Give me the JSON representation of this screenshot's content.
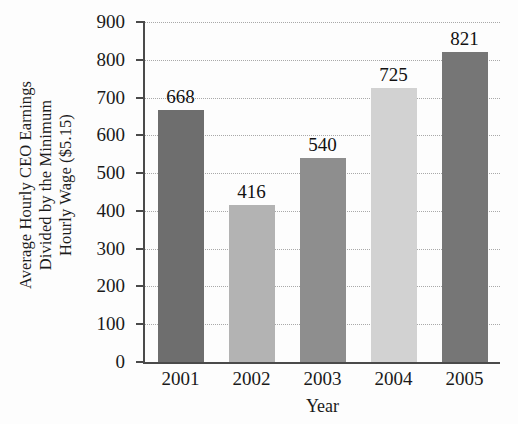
{
  "page_bleed_text": "",
  "chart_data": {
    "type": "bar",
    "title": "",
    "xlabel": "Year",
    "ylabel": "Average Hourly CEO Earnings Divided by the Minimum Hourly Wage ($5.15)",
    "ylabel_line1": "Average Hourly CEO Earnings",
    "ylabel_line2": "Divided by the Minimum",
    "ylabel_line3": "Hourly Wage ($5.15)",
    "categories": [
      "2001",
      "2002",
      "2003",
      "2004",
      "2005"
    ],
    "values": [
      668,
      416,
      540,
      725,
      821
    ],
    "value_labels": [
      "668",
      "416",
      "540",
      "725",
      "821"
    ],
    "bar_colors": [
      "#6e6e6e",
      "#b3b3b3",
      "#8e8e8e",
      "#d2d2d2",
      "#767676"
    ],
    "ylim": [
      0,
      900
    ],
    "ytick_values": [
      0,
      100,
      200,
      300,
      400,
      500,
      600,
      700,
      800,
      900
    ],
    "ytick_labels": [
      "0",
      "100",
      "200",
      "300",
      "400",
      "500",
      "600",
      "700",
      "800",
      "900"
    ],
    "grid": true,
    "grid_style": "dotted",
    "grid_color": "#a9a9a9",
    "legend": null,
    "legend_position": "none",
    "axis_color": "#4a4a4a",
    "background_color": "#fdfdfd"
  }
}
